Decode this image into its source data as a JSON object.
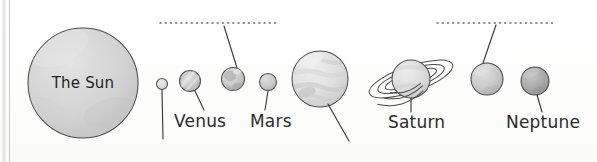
{
  "diagram": {
    "title": "The Sun",
    "sun": {
      "label": "The Sun",
      "cx": 83,
      "cy": 83,
      "r": 55,
      "fill": "#d2d2d2"
    },
    "dotted_guides": [
      {
        "name": "upper-guide-left",
        "x1": 160,
        "x2": 276,
        "y": 23
      },
      {
        "name": "upper-guide-right",
        "x1": 437,
        "x2": 553,
        "y": 23
      }
    ],
    "page_edge": {
      "x": 9,
      "color": "#c9c9c9"
    },
    "planets": [
      {
        "id": "mercury",
        "label": "",
        "cx": 162,
        "cy": 84,
        "r": 5.5,
        "fill": "#e0e0e0",
        "texture": "plain",
        "leader": {
          "x1": 162,
          "y1": 90,
          "x2": 163,
          "y2": 139
        },
        "label_x": 0,
        "label_y": 0
      },
      {
        "id": "venus",
        "label": "Venus",
        "cx": 190,
        "cy": 81,
        "r": 10.5,
        "fill": "#cfcfcf",
        "texture": "streak",
        "leader": {
          "x1": 195,
          "y1": 91,
          "x2": 204,
          "y2": 110
        },
        "label_x": 174,
        "label_y": 127
      },
      {
        "id": "earth",
        "label": "",
        "cx": 233,
        "cy": 79,
        "r": 11.5,
        "fill": "#c9c9c9",
        "texture": "continents",
        "leader": {
          "x1": 237,
          "y1": 68,
          "x2": 224,
          "y2": 26
        },
        "label_x": 0,
        "label_y": 0
      },
      {
        "id": "mars",
        "label": "Mars",
        "cx": 268,
        "cy": 82,
        "r": 8.5,
        "fill": "#bcbcbc",
        "texture": "plain",
        "leader": {
          "x1": 268,
          "y1": 91,
          "x2": 265,
          "y2": 110
        },
        "label_x": 250,
        "label_y": 127
      },
      {
        "id": "jupiter",
        "label": "",
        "cx": 320,
        "cy": 79,
        "r": 28,
        "fill": "#dcdcdc",
        "texture": "bands",
        "leader": {
          "x1": 328,
          "y1": 104,
          "x2": 349,
          "y2": 141
        },
        "label_x": 0,
        "label_y": 0
      },
      {
        "id": "saturn",
        "label": "Saturn",
        "cx": 411,
        "cy": 79,
        "r": 19,
        "fill": "#d6d6d6",
        "texture": "rings",
        "leader": {
          "x1": 411,
          "y1": 98,
          "x2": 411,
          "y2": 112
        },
        "label_x": 388,
        "label_y": 128
      },
      {
        "id": "uranus",
        "label": "",
        "cx": 487,
        "cy": 79,
        "r": 16,
        "fill": "#bfbfbf",
        "texture": "plain",
        "leader": {
          "x1": 483,
          "y1": 63,
          "x2": 496,
          "y2": 25
        },
        "label_x": 0,
        "label_y": 0
      },
      {
        "id": "neptune",
        "label": "Neptune",
        "cx": 535,
        "cy": 81,
        "r": 14,
        "fill": "#a8a8a8",
        "texture": "plain",
        "leader": {
          "x1": 537,
          "y1": 95,
          "x2": 542,
          "y2": 112
        },
        "label_x": 506,
        "label_y": 128
      }
    ]
  }
}
